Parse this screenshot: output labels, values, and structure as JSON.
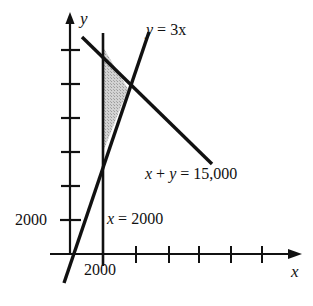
{
  "figure": {
    "kind": "cartesian-graph",
    "colors": {
      "ink": "#111111",
      "shade_fill": "#c8c8c8",
      "background": "#ffffff"
    }
  },
  "axes": {
    "x_label": "x",
    "y_label": "y",
    "x_tick_label": "2000",
    "y_tick_label": "2000",
    "x_tick_count": 6,
    "y_tick_count": 6,
    "x_first_tick_value": 2000,
    "y_first_tick_value": 2000,
    "arrows": [
      "x-positive",
      "y-positive"
    ]
  },
  "labels": {
    "line_y3x": "y = 3x",
    "line_sum": "x + y = 15,000",
    "line_vertical": "x = 2000"
  },
  "chart_data": {
    "type": "line",
    "title": "",
    "xlabel": "x",
    "ylabel": "y",
    "xlim": [
      0,
      16000
    ],
    "ylim": [
      0,
      16000
    ],
    "grid": false,
    "legend": "inline-annotations",
    "series": [
      {
        "name": "y = 3x",
        "equation": "y = 3x",
        "slope": 3,
        "intercept": 0,
        "points": [
          [
            -400,
            -1200
          ],
          [
            5000,
            15000
          ]
        ]
      },
      {
        "name": "x + y = 15,000",
        "equation": "x + y = 15000",
        "slope": -1,
        "intercept": 15000,
        "points": [
          [
            800,
            14200
          ],
          [
            8600,
            6400
          ]
        ]
      },
      {
        "name": "x = 2000",
        "equation": "x = 2000",
        "vertical_at": 2000,
        "points": [
          [
            2000,
            -700
          ],
          [
            2000,
            14600
          ]
        ]
      }
    ],
    "shaded_region": {
      "label": "feasible region",
      "fill": "#c8c8c8",
      "vertices": [
        [
          2000,
          13000
        ],
        [
          3750,
          11250
        ],
        [
          2000,
          6000
        ]
      ],
      "constraints": [
        "x >= 2000",
        "y <= 3x",
        "x + y <= 15000"
      ]
    },
    "annotations": [
      {
        "text": "y = 3x",
        "x": 5400,
        "y": 15500
      },
      {
        "text": "x + y = 15,000",
        "x": 7000,
        "y": 5000
      },
      {
        "text": "x = 2000",
        "x": 3000,
        "y": 2400
      },
      {
        "text": "2000",
        "axis": "y",
        "value": 2000
      },
      {
        "text": "2000",
        "axis": "x",
        "value": 2000
      }
    ]
  }
}
